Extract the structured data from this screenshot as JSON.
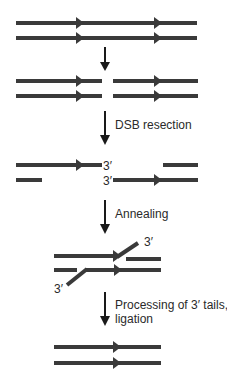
{
  "diagram": {
    "title": "",
    "colors": {
      "strand": "#3a3a3a",
      "arrow": "#1a1a1a",
      "text": "#2a2a2a",
      "background": "#ffffff"
    },
    "steps": [
      {
        "id": "intact",
        "description": "Intact duplex DNA"
      },
      {
        "id": "break",
        "description": "Double-strand break"
      },
      {
        "id": "resected",
        "description": "Resected ends with 3′ overhangs",
        "transition_label": "DSB resection"
      },
      {
        "id": "annealed",
        "description": "Annealed complementary repeats",
        "transition_label": "Annealing"
      },
      {
        "id": "repaired",
        "description": "Repaired duplex",
        "transition_label": "Processing of 3′ tails, ligation"
      }
    ],
    "labels": {
      "dsb_resection": "DSB resection",
      "annealing": "Annealing",
      "processing_line1": "Processing of 3′ tails,",
      "processing_line2": "ligation",
      "three_prime": "3′"
    }
  }
}
